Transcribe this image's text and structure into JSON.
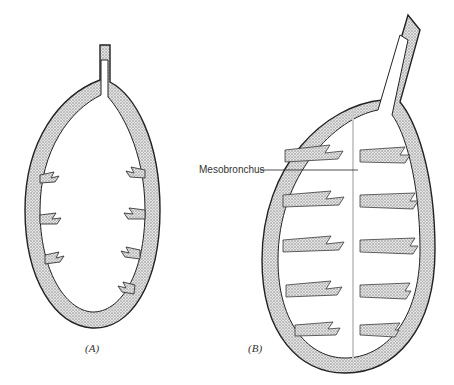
{
  "figure": {
    "panels": [
      {
        "id": "A",
        "caption": "(A)"
      },
      {
        "id": "B",
        "caption": "(B)"
      }
    ],
    "annotations": [
      {
        "label": "Mesobronchus",
        "target": "B"
      }
    ],
    "colors": {
      "stipple": "#bdbdbd",
      "outline": "#222222",
      "lumen": "#ffffff"
    }
  }
}
